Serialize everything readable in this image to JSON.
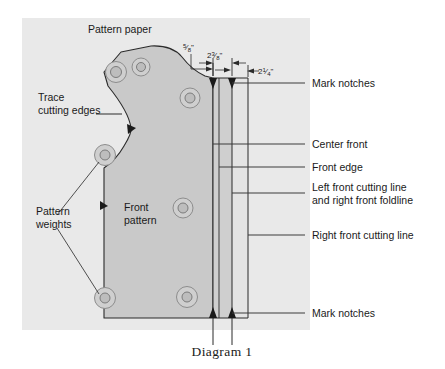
{
  "figure": {
    "caption": "Diagram 1",
    "paper_label": "Pattern paper",
    "piece_label_line1": "Front",
    "piece_label_line2": "pattern"
  },
  "colors": {
    "paper_fill": "#e9e9e9",
    "pattern_fill": "#c9c9c9",
    "outline": "#2b2b2b",
    "leader": "#3c3c3c",
    "text": "#1a1a1a",
    "page_background": "#ffffff",
    "weight_ring": "#b4b4b4",
    "weight_core": "#bdbdbd"
  },
  "dimensions": [
    {
      "id": "seam-allowance",
      "value": "5/8\"",
      "whole": "",
      "numerator": "5",
      "denominator": "8",
      "unit": "\""
    },
    {
      "id": "extension",
      "value": "2 3/8\"",
      "whole": "2",
      "numerator": "3",
      "denominator": "8",
      "unit": "\""
    },
    {
      "id": "facing-width",
      "value": "2 1/4\"",
      "whole": "2",
      "numerator": "1",
      "denominator": "4",
      "unit": "\""
    }
  ],
  "left_callouts": [
    {
      "id": "trace-cutting-edges",
      "line1": "Trace",
      "line2": "cutting edges"
    },
    {
      "id": "pattern-weights",
      "line1": "Pattern",
      "line2": "weights"
    }
  ],
  "right_callouts": [
    {
      "id": "mark-notches-top",
      "line1": "Mark notches",
      "line2": ""
    },
    {
      "id": "center-front",
      "line1": "Center front",
      "line2": ""
    },
    {
      "id": "front-edge",
      "line1": "Front edge",
      "line2": ""
    },
    {
      "id": "left-front-cutting-line",
      "line1": "Left front cutting line",
      "line2": "and right front foldline"
    },
    {
      "id": "right-front-cutting-line",
      "line1": "Right front cutting line",
      "line2": ""
    },
    {
      "id": "mark-notches-bottom",
      "line1": "Mark notches",
      "line2": ""
    }
  ],
  "guide_lines": [
    {
      "id": "center-front-line",
      "x": 213
    },
    {
      "id": "front-edge-line",
      "x": 219
    },
    {
      "id": "left-front-cutting-line",
      "x": 232
    },
    {
      "id": "right-front-cutting-line",
      "x": 248
    }
  ],
  "pattern_weights": [
    {
      "id": "weight-1",
      "cx": 116,
      "cy": 72
    },
    {
      "id": "weight-2",
      "cx": 141,
      "cy": 67
    },
    {
      "id": "weight-3",
      "cx": 190,
      "cy": 98
    },
    {
      "id": "weight-4",
      "cx": 105,
      "cy": 155
    },
    {
      "id": "weight-5",
      "cx": 183,
      "cy": 208
    },
    {
      "id": "weight-6",
      "cx": 105,
      "cy": 298
    },
    {
      "id": "weight-7",
      "cx": 187,
      "cy": 297
    }
  ],
  "notches": [
    {
      "id": "notch-top-left",
      "x": 213,
      "y": 82
    },
    {
      "id": "notch-top-right",
      "x": 232,
      "y": 82
    },
    {
      "id": "notch-bottom-left",
      "x": 213,
      "y": 318
    },
    {
      "id": "notch-bottom-right",
      "x": 232,
      "y": 318
    }
  ],
  "trace_arrows": [
    {
      "id": "trace-arrow-neckline",
      "x": 131,
      "y": 129
    },
    {
      "id": "trace-arrow-side",
      "x": 93,
      "y": 205
    }
  ]
}
